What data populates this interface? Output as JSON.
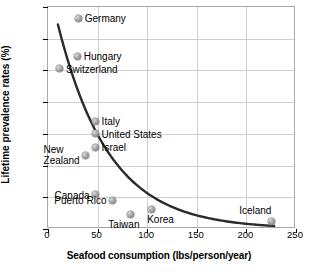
{
  "chart_data": {
    "type": "scatter",
    "title": "",
    "xlabel": "Seafood consumption (lbs/person/year)",
    "ylabel": "Lifetime prevalence rates (%)",
    "xlim": [
      0,
      250
    ],
    "ylim": [
      0,
      7
    ],
    "xticks": [
      0,
      50,
      100,
      150,
      200,
      250
    ],
    "yticks": [
      0,
      1,
      2,
      3,
      4,
      5,
      6,
      7
    ],
    "grid": true,
    "legend": "none",
    "marker_color": "#8c8c8c",
    "curve_color": "#2b2b2b",
    "grid_color": "#cfcfcf",
    "points": [
      {
        "label": "Germany",
        "x": 31,
        "y": 6.65,
        "label_pos": "right"
      },
      {
        "label": "Hungary",
        "x": 30,
        "y": 5.45,
        "label_pos": "right"
      },
      {
        "label": "Switzerland",
        "x": 12,
        "y": 5.05,
        "label_pos": "right"
      },
      {
        "label": "Italy",
        "x": 48,
        "y": 3.4,
        "label_pos": "right"
      },
      {
        "label": "United States",
        "x": 48,
        "y": 3.0,
        "label_pos": "right"
      },
      {
        "label": "Israel",
        "x": 48,
        "y": 2.57,
        "label_pos": "right"
      },
      {
        "label": "New\nZealand",
        "x": 38,
        "y": 2.32,
        "label_pos": "left"
      },
      {
        "label": "Canada",
        "x": 48,
        "y": 1.08,
        "label_pos": "left"
      },
      {
        "label": "Puerto Rico",
        "x": 65,
        "y": 0.9,
        "label_pos": "left"
      },
      {
        "label": "Taiwan",
        "x": 83,
        "y": 0.45,
        "label_pos": "below-left"
      },
      {
        "label": "Korea",
        "x": 104,
        "y": 0.6,
        "label_pos": "below-right"
      },
      {
        "label": "Iceland",
        "x": 225,
        "y": 0.25,
        "label_pos": "above-left"
      }
    ],
    "fit_curve": {
      "type": "exponential-decay",
      "description": "smooth decreasing trend line",
      "x_start": 10,
      "y_start": 6.45,
      "x_end": 228,
      "y_end": 0.05
    }
  }
}
